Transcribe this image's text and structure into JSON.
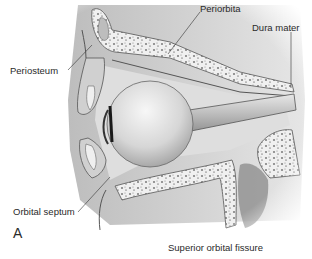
{
  "figure": {
    "panel": "A",
    "labels": {
      "periorbita": "Periorbita",
      "dura_mater": "Dura mater",
      "periosteum": "Periosteum",
      "orbital_septum": "Orbital septum",
      "superior_orbital_fissure": "Superior orbital fissure"
    },
    "colors": {
      "bone_fill": "#f2f2f2",
      "bone_speckle": "#4a4a4a",
      "soft_tissue": "#d9d9d9",
      "shadow": "#9a9a9a",
      "outline": "#555555",
      "globe": "#cfcfcf",
      "background": "#ffffff"
    }
  }
}
